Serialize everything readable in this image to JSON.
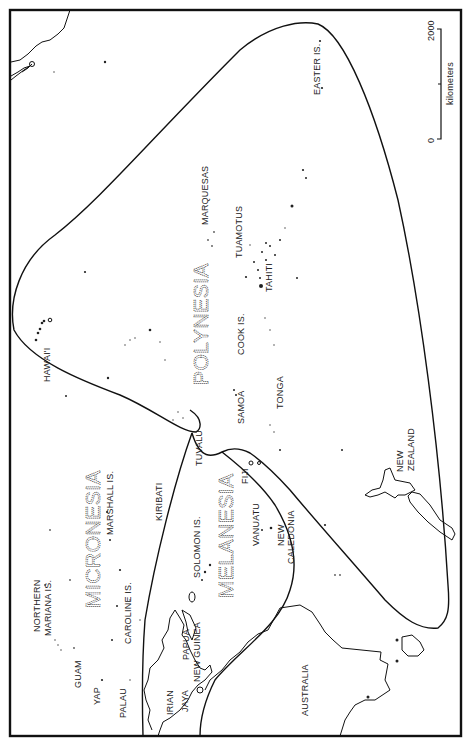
{
  "map": {
    "orientation": "rotated 90 degrees counter-clockwise",
    "regions": [
      {
        "name": "POLYNESIA"
      },
      {
        "name": "MICRONESIA"
      },
      {
        "name": "MELANESIA"
      }
    ],
    "places": [
      {
        "id": "marquesas",
        "label": "MARQUESAS"
      },
      {
        "id": "tuamotus",
        "label": "TUAMOTUS"
      },
      {
        "id": "tahiti",
        "label": "TAHITI"
      },
      {
        "id": "easter",
        "label": "EASTER IS."
      },
      {
        "id": "hawaii",
        "label": "HAWAI'I"
      },
      {
        "id": "cook",
        "label": "COOK IS."
      },
      {
        "id": "samoa",
        "label": "SAMOA"
      },
      {
        "id": "tonga",
        "label": "TONGA"
      },
      {
        "id": "tuvalu",
        "label": "TUVALU"
      },
      {
        "id": "fiji",
        "label": "FIJI"
      },
      {
        "id": "nz1",
        "label": "NEW"
      },
      {
        "id": "nz2",
        "label": "ZEALAND"
      },
      {
        "id": "kiribati",
        "label": "KIRIBATI"
      },
      {
        "id": "marshall",
        "label": "MARSHALL IS."
      },
      {
        "id": "solomon",
        "label": "SOLOMON IS."
      },
      {
        "id": "vanuatu",
        "label": "VANUATU"
      },
      {
        "id": "newcal1",
        "label": "NEW"
      },
      {
        "id": "newcal2",
        "label": "CALEDONIA"
      },
      {
        "id": "nmar1",
        "label": "NORTHERN"
      },
      {
        "id": "nmar2",
        "label": "MARIANA IS."
      },
      {
        "id": "caroline",
        "label": "CAROLINE IS."
      },
      {
        "id": "guam",
        "label": "GUAM"
      },
      {
        "id": "yap",
        "label": "YAP"
      },
      {
        "id": "palau",
        "label": "PALAU"
      },
      {
        "id": "png1",
        "label": "PAPUA"
      },
      {
        "id": "png2",
        "label": "NEW GUINEA"
      },
      {
        "id": "irian1",
        "label": "IRIAN"
      },
      {
        "id": "irian2",
        "label": "JAYA"
      },
      {
        "id": "australia",
        "label": "AUSTRALIA"
      }
    ],
    "scale_bar": {
      "unit": "kilometers",
      "min_label": "0",
      "max_label": "2000"
    }
  }
}
